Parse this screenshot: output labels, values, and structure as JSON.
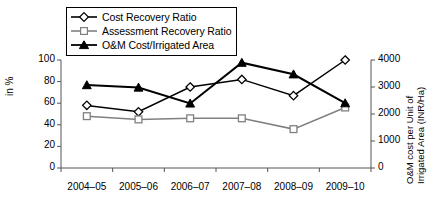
{
  "chart_data": {
    "type": "line",
    "title": "",
    "xlabel": "",
    "ylabel": "in %",
    "y2label": "O&M cost per Unit of Irrigated Area  (INR/Ha)",
    "y2label_line1": "O&M cost per Unit of",
    "y2label_line2": "Irrigated Area  (INR/Ha)",
    "categories": [
      "2004–05",
      "2005–06",
      "2006–07",
      "2007–08",
      "2008–09",
      "2009–10"
    ],
    "ylim": [
      0,
      100
    ],
    "y2lim": [
      0,
      4000
    ],
    "yticks": [
      0,
      20,
      40,
      60,
      80,
      100
    ],
    "y2ticks": [
      0,
      1000,
      2000,
      3000,
      4000
    ],
    "grid": false,
    "legend_position": "top-left",
    "series": [
      {
        "name": "Cost Recovery Ratio",
        "axis": "left",
        "marker": "open-diamond",
        "color": "#000000",
        "values": [
          58,
          52,
          75,
          82,
          67,
          100
        ]
      },
      {
        "name": "Assessment Recovery Ratio",
        "axis": "left",
        "marker": "open-square",
        "color": "#808080",
        "values": [
          48,
          45,
          46,
          46,
          36,
          56
        ]
      },
      {
        "name": "O&M Cost/Irrigated Area",
        "axis": "right",
        "marker": "filled-triangle",
        "color": "#000000",
        "values": [
          3070,
          2980,
          2390,
          3900,
          3470,
          2400
        ]
      }
    ]
  },
  "legend": {
    "items": [
      {
        "label": "Cost Recovery Ratio",
        "icon": "open-diamond-marker-icon"
      },
      {
        "label": "Assessment Recovery Ratio",
        "icon": "open-square-marker-icon"
      },
      {
        "label": "O&M Cost/Irrigated Area",
        "icon": "filled-triangle-marker-icon"
      }
    ]
  }
}
